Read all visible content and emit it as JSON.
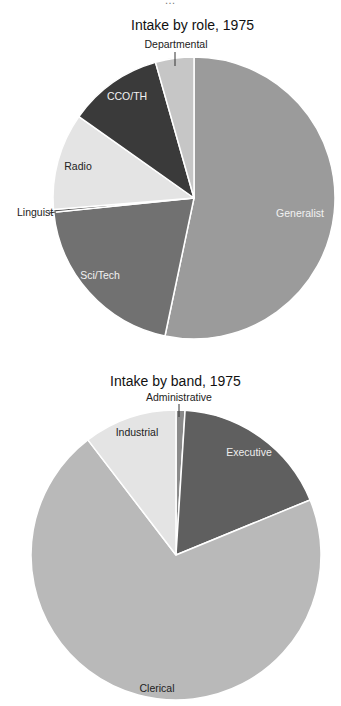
{
  "chart_data": [
    {
      "type": "pie",
      "title": "Intake by role, 1975",
      "categories": [
        "Generalist",
        "Sci/Tech",
        "Linguist",
        "Radio",
        "CCO/TH",
        "Departmental"
      ],
      "values": [
        53.3,
        20.1,
        0.3,
        11.1,
        10.8,
        4.4
      ],
      "colors": [
        "#9b9b9b",
        "#717171",
        "#4f4f4f",
        "#e4e4e4",
        "#3a3a3a",
        "#c6c6c6"
      ],
      "label_colors": [
        "#f2f2f2",
        "#f2f2f2",
        "#222222",
        "#222222",
        "#f2f2f2",
        "#222222"
      ],
      "start_angle_deg": 0,
      "direction": "clockwise",
      "legend": "none (labels on slices)",
      "grid": false
    },
    {
      "type": "pie",
      "title": "Intake by band, 1975",
      "categories": [
        "Administrative",
        "Executive",
        "Clerical",
        "Industrial"
      ],
      "values": [
        1.0,
        17.8,
        70.8,
        10.4
      ],
      "colors": [
        "#8a8a8a",
        "#5f5f5f",
        "#b9b9b9",
        "#e4e4e4"
      ],
      "label_colors": [
        "#222222",
        "#eeeeee",
        "#222222",
        "#222222"
      ],
      "start_angle_deg": 0,
      "direction": "clockwise",
      "legend": "none (labels on slices)",
      "grid": false
    }
  ],
  "page": {
    "top_fragment": "…"
  }
}
